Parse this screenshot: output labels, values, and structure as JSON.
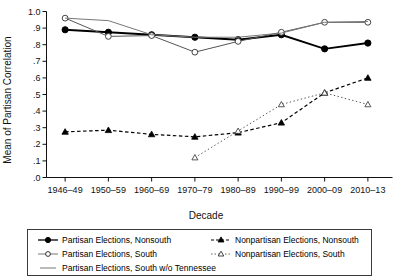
{
  "chart_data": {
    "type": "line",
    "title": "",
    "xlabel": "Decade",
    "ylabel": "Mean of Partisan Correlation",
    "categories": [
      "1946–49",
      "1950–59",
      "1960–69",
      "1970–79",
      "1980–89",
      "1990–99",
      "2000–09",
      "2010–13"
    ],
    "ylim": [
      0.0,
      1.0
    ],
    "yticks": [
      0.0,
      0.1,
      0.2,
      0.3,
      0.4,
      0.5,
      0.6,
      0.7,
      0.8,
      0.9,
      1.0
    ],
    "ytick_labels": [
      ".0",
      ".1",
      ".2",
      ".3",
      ".4",
      ".5",
      ".6",
      ".7",
      ".8",
      ".9",
      "1.0"
    ],
    "grid": false,
    "legend_position": "bottom",
    "series": [
      {
        "name": "Partisan Elections, Nonsouth",
        "marker": "filled-circle",
        "line": "solid",
        "color": "#000000",
        "values": [
          0.89,
          0.875,
          0.86,
          0.845,
          0.83,
          0.86,
          0.775,
          0.81
        ]
      },
      {
        "name": "Partisan Elections, South",
        "marker": "open-circle",
        "line": "solid",
        "color": "#555555",
        "values": [
          0.96,
          0.85,
          0.855,
          0.755,
          0.82,
          0.875,
          0.935,
          0.935
        ]
      },
      {
        "name": "Partisan Elections, South w/o Tennessee",
        "marker": "none",
        "line": "solid",
        "color": "#777777",
        "values": [
          0.96,
          0.945,
          0.86,
          0.845,
          0.845,
          0.87,
          0.935,
          0.94
        ]
      },
      {
        "name": "Nonpartisan Elections, Nonsouth",
        "marker": "filled-triangle",
        "line": "dashed",
        "color": "#000000",
        "values": [
          0.275,
          0.285,
          0.26,
          0.245,
          0.27,
          0.33,
          0.51,
          0.6
        ]
      },
      {
        "name": "Nonpartisan Elections, South",
        "marker": "open-triangle",
        "line": "dotted",
        "color": "#555555",
        "values": [
          null,
          null,
          null,
          0.12,
          0.28,
          0.44,
          0.51,
          0.44
        ]
      }
    ]
  },
  "axes": {
    "y_label": "Mean of Partisan Correlation",
    "x_label": "Decade",
    "y_ticks": [
      "1.0",
      ".9",
      ".8",
      ".7",
      ".6",
      ".5",
      ".4",
      ".3",
      ".2",
      ".1",
      ".0"
    ],
    "x_ticks": [
      "1946–49",
      "1950–59",
      "1960–69",
      "1970–79",
      "1980–89",
      "1990–99",
      "2000–09",
      "2010–13"
    ]
  },
  "legend": {
    "entries": [
      {
        "label": "Partisan Elections, Nonsouth",
        "marker": "filled-circle",
        "line": "solid"
      },
      {
        "label": "Partisan Elections, South",
        "marker": "open-circle",
        "line": "solid"
      },
      {
        "label": "Partisan Elections, South w/o Tennessee",
        "marker": "none",
        "line": "solid"
      },
      {
        "label": "Nonpartisan Elections, Nonsouth",
        "marker": "filled-triangle",
        "line": "dashed"
      },
      {
        "label": "Nonpartisan Elections, South",
        "marker": "open-triangle",
        "line": "dotted"
      }
    ]
  },
  "colors": {
    "ink": "#000000",
    "mid": "#555555",
    "light": "#777777",
    "background": "#ffffff"
  }
}
